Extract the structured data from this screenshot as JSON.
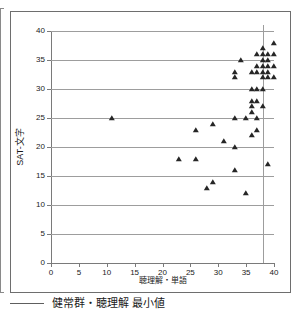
{
  "chart_data": {
    "type": "scatter",
    "title": "",
    "xlabel": "聴理解・単語",
    "ylabel": "SAT-文字",
    "xlim": [
      0,
      40
    ],
    "ylim": [
      0,
      40
    ],
    "xticks": [
      0,
      5,
      10,
      15,
      20,
      25,
      30,
      35,
      40
    ],
    "yticks": [
      0,
      5,
      10,
      15,
      20,
      25,
      30,
      35,
      40
    ],
    "grid": "horizontal",
    "legend_position": "below-plot",
    "marker": "triangle",
    "marker_color": "#262626",
    "gridline_color": "#9d9d9d",
    "axis_color": "#7a7a7a",
    "reference_lines": [
      {
        "name": "健常群・聴理解 最小値",
        "orientation": "vertical",
        "x": 38,
        "color": "#9d9d9d"
      }
    ],
    "series": [
      {
        "name": "散布データ",
        "points": [
          [
            11,
            25
          ],
          [
            23,
            18
          ],
          [
            26,
            18
          ],
          [
            26,
            23
          ],
          [
            28,
            13
          ],
          [
            29,
            14
          ],
          [
            29,
            24
          ],
          [
            31,
            21
          ],
          [
            33,
            16
          ],
          [
            33,
            20
          ],
          [
            33,
            25
          ],
          [
            33,
            32
          ],
          [
            33,
            33
          ],
          [
            34,
            35
          ],
          [
            35,
            12
          ],
          [
            35,
            25
          ],
          [
            36,
            22
          ],
          [
            36,
            26
          ],
          [
            36,
            27
          ],
          [
            36,
            28
          ],
          [
            36,
            30
          ],
          [
            36,
            33
          ],
          [
            37,
            23
          ],
          [
            37,
            25
          ],
          [
            37,
            28
          ],
          [
            37,
            30
          ],
          [
            37,
            33
          ],
          [
            37,
            34
          ],
          [
            37,
            36
          ],
          [
            38,
            27
          ],
          [
            38,
            30
          ],
          [
            38,
            32
          ],
          [
            38,
            33
          ],
          [
            38,
            34
          ],
          [
            38,
            35
          ],
          [
            38,
            36
          ],
          [
            38,
            37
          ],
          [
            39,
            17
          ],
          [
            39,
            32
          ],
          [
            39,
            33
          ],
          [
            39,
            34
          ],
          [
            39,
            35
          ],
          [
            39,
            36
          ],
          [
            40,
            32
          ],
          [
            40,
            34
          ],
          [
            40,
            36
          ],
          [
            40,
            38
          ]
        ]
      }
    ]
  },
  "legend": {
    "label": "健常群・聴理解 最小値"
  }
}
